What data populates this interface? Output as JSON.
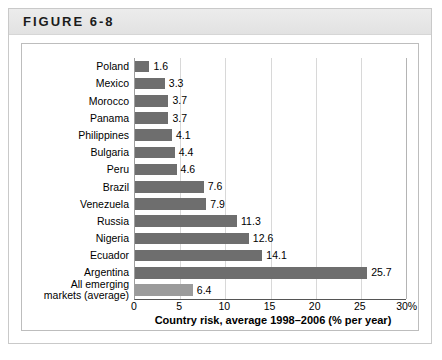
{
  "figure": {
    "banner_label": "FIGURE 6-8"
  },
  "chart_data": {
    "type": "bar",
    "orientation": "horizontal",
    "title": "",
    "xlabel": "Country risk, average 1998–2006 (% per year)",
    "ylabel": "",
    "xlim": [
      0,
      30
    ],
    "xticks": [
      "0",
      "5",
      "10",
      "15",
      "20",
      "25",
      "30%"
    ],
    "xtick_values": [
      0,
      5,
      10,
      15,
      20,
      25,
      30
    ],
    "grid": true,
    "legend": "none",
    "categories": [
      "Poland",
      "Mexico",
      "Morocco",
      "Panama",
      "Philippines",
      "Bulgaria",
      "Peru",
      "Brazil",
      "Venezuela",
      "Russia",
      "Nigeria",
      "Ecuador",
      "Argentina",
      "All emerging\nmarkets (average)"
    ],
    "values": [
      1.6,
      3.3,
      3.7,
      3.7,
      4.1,
      4.4,
      4.6,
      7.6,
      7.9,
      11.3,
      12.6,
      14.1,
      25.7,
      6.4
    ],
    "value_labels": [
      "1.6",
      "3.3",
      "3.7",
      "3.7",
      "4.1",
      "4.4",
      "4.6",
      "7.6",
      "7.9",
      "11.3",
      "12.6",
      "14.1",
      "25.7",
      "6.4"
    ],
    "bar_colors": [
      "#6e6e6e",
      "#6e6e6e",
      "#6e6e6e",
      "#6e6e6e",
      "#6e6e6e",
      "#6e6e6e",
      "#6e6e6e",
      "#6e6e6e",
      "#6e6e6e",
      "#6e6e6e",
      "#6e6e6e",
      "#6e6e6e",
      "#6e6e6e",
      "#9b9b9b"
    ],
    "highlight_color": "#9b9b9b",
    "series_color": "#6e6e6e"
  }
}
